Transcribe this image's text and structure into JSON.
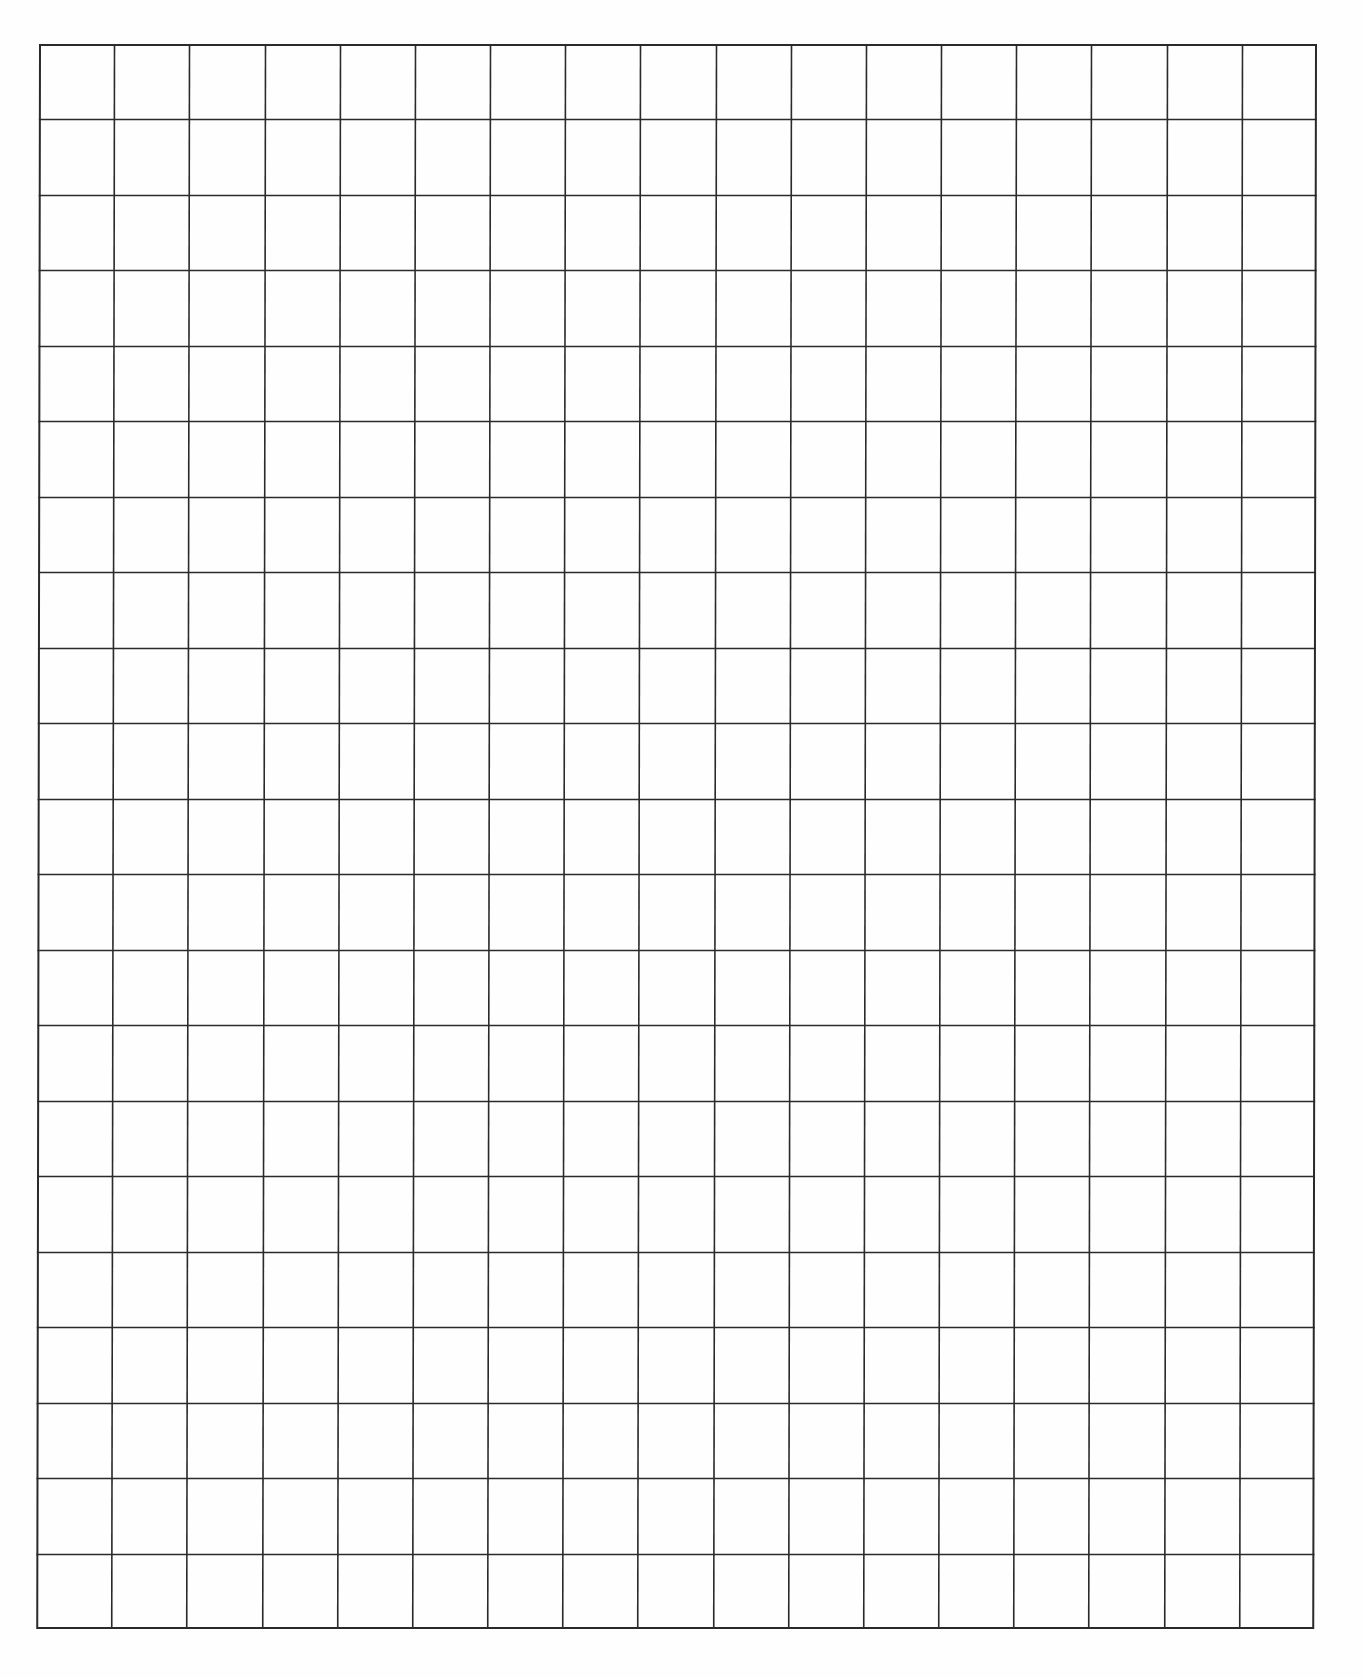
{
  "page": {
    "type": "graph-paper",
    "background_color": "#ffffff",
    "line_color": "#2a2a2a"
  },
  "grid": {
    "columns": 17,
    "rows": 21,
    "left": 39,
    "top": 44,
    "right": 1317,
    "bottom": 1629,
    "cell_size": 75.2,
    "line_width": 1.6,
    "skew_x_deg": 0.1
  }
}
